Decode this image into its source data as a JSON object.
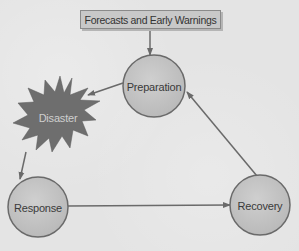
{
  "diagram": {
    "title_box": {
      "label": "Forecasts and Early Warnings"
    },
    "nodes": [
      {
        "id": "preparation",
        "label": "Preparation",
        "shape": "circle"
      },
      {
        "id": "disaster",
        "label": "Disaster",
        "shape": "starburst"
      },
      {
        "id": "response",
        "label": "Response",
        "shape": "circle"
      },
      {
        "id": "recovery",
        "label": "Recovery",
        "shape": "circle"
      }
    ],
    "edges": [
      {
        "from": "Forecasts and Early Warnings",
        "to": "Preparation"
      },
      {
        "from": "Preparation",
        "to": "Disaster"
      },
      {
        "from": "Disaster",
        "to": "Response"
      },
      {
        "from": "Response",
        "to": "Recovery"
      },
      {
        "from": "Recovery",
        "to": "Preparation"
      }
    ],
    "colors": {
      "background": "#e4e4e4",
      "circle_fill": "#c4c4c4",
      "circle_stroke": "#6a6a6a",
      "starburst_fill": "#6e6e6e",
      "box_fill": "#c8c8c8",
      "arrow": "#707070"
    }
  }
}
